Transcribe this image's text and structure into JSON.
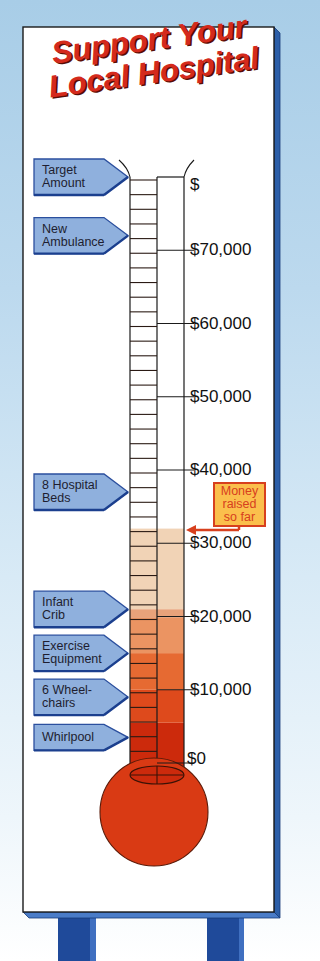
{
  "sign": {
    "title_line1": "Support Your",
    "title_line2": "Local Hospital"
  },
  "colors": {
    "background_top": "#a8cde7",
    "board": "#ffffff",
    "board_edge": "#2d5fa8",
    "legs": "#1f4a9a",
    "title": "#d42a1c",
    "label_fill": "#8fb0dd",
    "label_border": "#2b4f9e",
    "bulb": "#d93a14",
    "money_box_fill": "#fbbf4c",
    "money_box_border": "#d7401e"
  },
  "money_raised": {
    "label_line1": "Money",
    "label_line2": "raised",
    "label_line3": "so far"
  },
  "chart_data": {
    "type": "thermometer",
    "title": "Support Your Local Hospital",
    "unit": "$",
    "ylim": [
      0,
      80000
    ],
    "ticks": [
      {
        "value": 0,
        "label": "$0"
      },
      {
        "value": 10000,
        "label": "$10,000"
      },
      {
        "value": 20000,
        "label": "$20,000"
      },
      {
        "value": 30000,
        "label": "$30,000"
      },
      {
        "value": 40000,
        "label": "$40,000"
      },
      {
        "value": 50000,
        "label": "$50,000"
      },
      {
        "value": 60000,
        "label": "$60,000"
      },
      {
        "value": 70000,
        "label": "$70,000"
      },
      {
        "value": 80000,
        "label": "$"
      }
    ],
    "minor_step": 2000,
    "raised_so_far": 32000,
    "fill_bands": [
      {
        "from": 0,
        "to": 5500,
        "color": "#cc2a0c"
      },
      {
        "from": 5500,
        "to": 10000,
        "color": "#de4a1c"
      },
      {
        "from": 10000,
        "to": 15000,
        "color": "#e66a32"
      },
      {
        "from": 15000,
        "to": 19800,
        "color": "#eb9462"
      },
      {
        "from": 19800,
        "to": 21000,
        "color": "#e8a27a"
      },
      {
        "from": 21000,
        "to": 32000,
        "color": "#f1d3b6"
      }
    ],
    "goals": [
      {
        "label_lines": [
          "Target",
          "Amount"
        ],
        "value": 80000
      },
      {
        "label_lines": [
          "New",
          "Ambulance"
        ],
        "value": 72000
      },
      {
        "label_lines": [
          "8 Hospital",
          "Beds"
        ],
        "value": 37000
      },
      {
        "label_lines": [
          "Infant",
          "Crib"
        ],
        "value": 21000
      },
      {
        "label_lines": [
          "Exercise",
          "Equipment"
        ],
        "value": 15000
      },
      {
        "label_lines": [
          "6 Wheel-",
          "chairs"
        ],
        "value": 9000
      },
      {
        "label_lines": [
          "Whirlpool"
        ],
        "value": 3500
      }
    ],
    "annotation": "Money raised so far"
  }
}
